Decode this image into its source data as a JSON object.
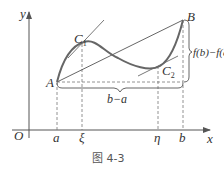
{
  "figure": {
    "caption": "图 4-3",
    "axes": {
      "x_label": "x",
      "y_label": "y",
      "origin_label": "O"
    },
    "points": {
      "A": "A",
      "B": "B",
      "C1": "C",
      "C1_sub": "1",
      "C2": "C",
      "C2_sub": "2"
    },
    "x_ticks": [
      "a",
      "ξ",
      "η",
      "b"
    ],
    "annotations": {
      "horizontal_span": "b−a",
      "vertical_span": "f(b)−f(a)"
    },
    "colors": {
      "curve": "#666666",
      "lines": "#555555",
      "dashed": "#777777",
      "text": "#333333"
    }
  }
}
